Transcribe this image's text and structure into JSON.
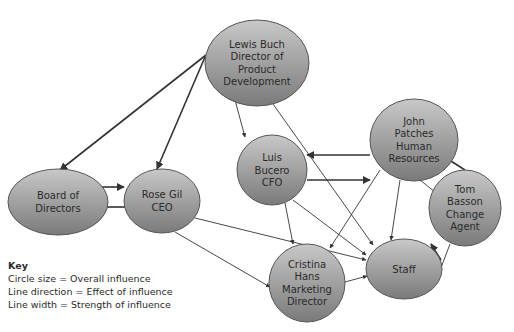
{
  "colors": {
    "node_fill_top": "#c4c4c4",
    "node_fill_bottom": "#7e7e7e",
    "node_stroke": "#555555",
    "edge": "#333333",
    "text": "#2a2a2a"
  },
  "nodes": [
    {
      "id": "lewis",
      "lines": [
        "Lewis Buch",
        "Director of",
        "Product",
        "Development"
      ],
      "cx": 257,
      "cy": 63,
      "rx": 52,
      "ry": 43
    },
    {
      "id": "board",
      "lines": [
        "Board of",
        "Directors"
      ],
      "cx": 58,
      "cy": 202,
      "rx": 50,
      "ry": 33
    },
    {
      "id": "rose",
      "lines": [
        "Rose Gil",
        "CEO"
      ],
      "cx": 162,
      "cy": 201,
      "rx": 38,
      "ry": 32
    },
    {
      "id": "luis",
      "lines": [
        "Luis",
        "Bucero",
        "CFO"
      ],
      "cx": 272,
      "cy": 170,
      "rx": 35,
      "ry": 35
    },
    {
      "id": "john",
      "lines": [
        "John",
        "Patches",
        "Human",
        "Resources"
      ],
      "cx": 414,
      "cy": 140,
      "rx": 44,
      "ry": 41
    },
    {
      "id": "tom",
      "lines": [
        "Tom",
        "Basson",
        "Change",
        "Agent"
      ],
      "cx": 465,
      "cy": 208,
      "rx": 36,
      "ry": 38
    },
    {
      "id": "cristina",
      "lines": [
        "Cristina",
        "Hans",
        "Marketing",
        "Director"
      ],
      "cx": 307,
      "cy": 283,
      "rx": 38,
      "ry": 39
    },
    {
      "id": "staff",
      "lines": [
        "Staff"
      ],
      "cx": 404,
      "cy": 269,
      "rx": 38,
      "ry": 30
    }
  ],
  "edges": [
    {
      "from": "lewis",
      "to": "board",
      "x1": 206,
      "y1": 55,
      "x2": 60,
      "y2": 170,
      "width": 1.6
    },
    {
      "from": "lewis",
      "to": "rose",
      "x1": 205,
      "y1": 57,
      "x2": 157,
      "y2": 169,
      "width": 1.6
    },
    {
      "from": "lewis",
      "to": "luis",
      "x1": 235,
      "y1": 100,
      "x2": 245,
      "y2": 137,
      "width": 0.9
    },
    {
      "from": "lewis",
      "to": "staff",
      "x1": 273,
      "y1": 104,
      "x2": 373,
      "y2": 245,
      "width": 0.9
    },
    {
      "from": "board",
      "to": "rose",
      "x1": 98,
      "y1": 187,
      "x2": 124,
      "y2": 187,
      "width": 1.6
    },
    {
      "from": "rose",
      "to": "board",
      "x1": 128,
      "y1": 207,
      "x2": 98,
      "y2": 207,
      "width": 1.6
    },
    {
      "from": "rose",
      "to": "staff",
      "x1": 195,
      "y1": 218,
      "x2": 366,
      "y2": 260,
      "width": 0.9
    },
    {
      "from": "rose",
      "to": "cristina",
      "x1": 175,
      "y1": 232,
      "x2": 270,
      "y2": 287,
      "width": 0.9
    },
    {
      "from": "john",
      "to": "luis",
      "x1": 370,
      "y1": 155,
      "x2": 307,
      "y2": 155,
      "width": 1.6
    },
    {
      "from": "luis",
      "to": "john",
      "x1": 307,
      "y1": 180,
      "x2": 370,
      "y2": 180,
      "width": 1.6
    },
    {
      "from": "luis",
      "to": "cristina",
      "x1": 285,
      "y1": 203,
      "x2": 293,
      "y2": 244,
      "width": 0.9
    },
    {
      "from": "luis",
      "to": "staff",
      "x1": 293,
      "y1": 200,
      "x2": 366,
      "y2": 255,
      "width": 0.9
    },
    {
      "from": "john",
      "to": "cristina",
      "x1": 380,
      "y1": 170,
      "x2": 330,
      "y2": 248,
      "width": 0.9
    },
    {
      "from": "john",
      "to": "staff",
      "x1": 400,
      "y1": 180,
      "x2": 391,
      "y2": 240,
      "width": 0.9
    },
    {
      "from": "john",
      "to": "tom",
      "x1": 420,
      "y1": 180,
      "x2": 440,
      "y2": 196,
      "width": 0.9
    },
    {
      "from": "tom",
      "to": "john",
      "x1": 465,
      "y1": 170,
      "x2": 432,
      "y2": 149,
      "width": 1.6
    },
    {
      "from": "staff",
      "to": "tom",
      "x1": 441,
      "y1": 260,
      "x2": 431,
      "y2": 244,
      "width": 1.6
    },
    {
      "from": "tom",
      "to": "staff",
      "x1": 450,
      "y1": 244,
      "x2": 436,
      "y2": 281,
      "width": 0.9
    },
    {
      "from": "cristina",
      "to": "staff",
      "x1": 345,
      "y1": 282,
      "x2": 367,
      "y2": 276,
      "width": 0.9
    }
  ],
  "key": {
    "title": "Key",
    "lines": [
      "Circle size = Overall influence",
      "Line direction = Effect of influence",
      "Line width = Strength of influence"
    ]
  }
}
